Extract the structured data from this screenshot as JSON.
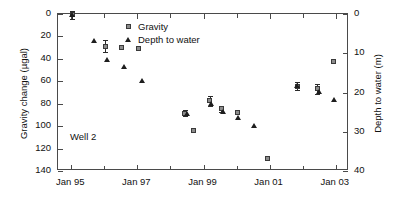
{
  "chart_data": {
    "type": "scatter",
    "title": "",
    "annotation": "Well 2",
    "xlabel": "",
    "ylabel_left": "Gravity change (µgal)",
    "ylabel_right": "Depth to water (m)",
    "grid": false,
    "legend_position": "top-center",
    "x_tick_labels": [
      "Jan 95",
      "Jan 97",
      "Jan 99",
      "Jan 01",
      "Jan 03"
    ],
    "x_tick_values": [
      1995.0,
      1997.0,
      1999.0,
      2001.0,
      2003.0
    ],
    "x_minor_tick_values": [
      1996.0,
      1998.0,
      2000.0,
      2002.0
    ],
    "xlim": [
      1994.6,
      2003.4
    ],
    "y_left_tick_labels": [
      "0",
      "20",
      "40",
      "60",
      "80",
      "100",
      "120",
      "140"
    ],
    "y_left_tick_values": [
      0,
      20,
      40,
      60,
      80,
      100,
      120,
      140
    ],
    "ylim_left": [
      140,
      0
    ],
    "y_left_inverted": true,
    "y_right_tick_labels": [
      "0",
      "10",
      "20",
      "30",
      "40"
    ],
    "y_right_tick_values": [
      0,
      10,
      20,
      30,
      40
    ],
    "ylim_right": [
      40,
      0
    ],
    "y_right_inverted": true,
    "series": [
      {
        "name": "Gravity",
        "marker": "square",
        "color": "#8c8c8c",
        "edge_color": "#3a3a3a",
        "axis": "left",
        "points": [
          {
            "x": 1995.05,
            "y": 1,
            "yerr": 4
          },
          {
            "x": 1996.05,
            "y": 29,
            "yerr": 6
          },
          {
            "x": 1996.55,
            "y": 30,
            "yerr": 0
          },
          {
            "x": 1997.05,
            "y": 31,
            "yerr": 0
          },
          {
            "x": 1998.45,
            "y": 89,
            "yerr": 3
          },
          {
            "x": 1998.7,
            "y": 104,
            "yerr": 0
          },
          {
            "x": 1999.2,
            "y": 78,
            "yerr": 5
          },
          {
            "x": 1999.55,
            "y": 85,
            "yerr": 3
          },
          {
            "x": 2000.05,
            "y": 88,
            "yerr": 0
          },
          {
            "x": 2000.95,
            "y": 129,
            "yerr": 0
          },
          {
            "x": 2001.85,
            "y": 65,
            "yerr": 4
          },
          {
            "x": 2002.45,
            "y": 67,
            "yerr": 5
          },
          {
            "x": 2002.95,
            "y": 43,
            "yerr": 0
          }
        ]
      },
      {
        "name": "Depth to water",
        "marker": "triangle",
        "color": "#1e1e1e",
        "axis": "right",
        "points": [
          {
            "x": 1995.05,
            "y": 0.3
          },
          {
            "x": 1995.7,
            "y": 7.0
          },
          {
            "x": 1996.1,
            "y": 11.7
          },
          {
            "x": 1996.6,
            "y": 13.5
          },
          {
            "x": 1997.15,
            "y": 17.0
          },
          {
            "x": 1998.5,
            "y": 25.5
          },
          {
            "x": 1999.25,
            "y": 23.0
          },
          {
            "x": 1999.6,
            "y": 25.0
          },
          {
            "x": 2000.05,
            "y": 26.5
          },
          {
            "x": 2000.55,
            "y": 28.5
          },
          {
            "x": 2001.85,
            "y": 18.5
          },
          {
            "x": 2002.5,
            "y": 20.0
          },
          {
            "x": 2002.95,
            "y": 22.0
          }
        ]
      }
    ],
    "legend": [
      {
        "label": "Gravity",
        "marker": "square"
      },
      {
        "label": "Depth to water",
        "marker": "triangle"
      }
    ]
  }
}
